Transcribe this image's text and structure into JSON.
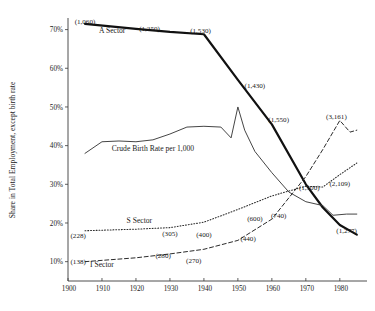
{
  "chart_data": {
    "type": "line",
    "title": "",
    "xlabel": "",
    "ylabel": "Share in Total Employment, except birth rate",
    "xlim": [
      1900,
      1988
    ],
    "ylim": [
      5,
      73
    ],
    "grid": false,
    "legend": "inline-labels",
    "x_ticks": [
      "1900",
      "1910",
      "1920",
      "1930",
      "1940",
      "1950",
      "1960",
      "1970",
      "1980"
    ],
    "x_tick_values": [
      1900,
      1910,
      1920,
      1930,
      1940,
      1950,
      1960,
      1970,
      1980
    ],
    "y_ticks": [
      "10%",
      "20%",
      "30%",
      "40%",
      "50%",
      "60%",
      "70%"
    ],
    "y_tick_values": [
      10,
      20,
      30,
      40,
      50,
      60,
      70
    ],
    "series": [
      {
        "name": "A Sector",
        "style": "thick-solid",
        "x": [
          1905,
          1920,
          1930,
          1940,
          1950,
          1960,
          1970,
          1975,
          1980,
          1985
        ],
        "values": [
          71.5,
          70.2,
          69.4,
          68.8,
          57.0,
          45.5,
          30.0,
          24.0,
          19.5,
          17.0
        ],
        "point_labels": [
          {
            "text": "(1,060)",
            "x": 1905,
            "y": 71.5
          },
          {
            "text": "(1,250)",
            "x": 1924,
            "y": 69.6
          },
          {
            "text": "(1,530)",
            "x": 1939,
            "y": 69.0
          },
          {
            "text": "(1,430)",
            "x": 1955,
            "y": 55.0
          },
          {
            "text": "(1,550)",
            "x": 1962,
            "y": 46.0
          },
          {
            "text": "(1,500)",
            "x": 1971,
            "y": 28.5
          },
          {
            "text": "(1,277)",
            "x": 1982,
            "y": 17.5
          }
        ]
      },
      {
        "name": "Crude Birth Rate per 1,000",
        "style": "thin-solid",
        "x": [
          1905,
          1910,
          1915,
          1920,
          1925,
          1930,
          1935,
          1940,
          1945,
          1948,
          1950,
          1952,
          1955,
          1960,
          1965,
          1970,
          1975,
          1978,
          1982,
          1985
        ],
        "values": [
          38.0,
          41.0,
          41.2,
          41.0,
          41.5,
          43.0,
          44.8,
          45.0,
          44.8,
          42.0,
          50.0,
          44.0,
          38.5,
          33.0,
          28.0,
          25.5,
          24.5,
          22.0,
          22.3,
          22.3
        ]
      },
      {
        "name": "S Sector",
        "style": "dotted",
        "x": [
          1905,
          1920,
          1930,
          1940,
          1950,
          1960,
          1970,
          1975,
          1980,
          1985
        ],
        "values": [
          18.0,
          18.4,
          18.8,
          20.2,
          23.5,
          27.0,
          29.5,
          29.3,
          32.5,
          35.5
        ],
        "point_labels": [
          {
            "text": "(228)",
            "x": 1903,
            "y": 16.2
          },
          {
            "text": "(305)",
            "x": 1930,
            "y": 16.6
          },
          {
            "text": "(400)",
            "x": 1940,
            "y": 16.4
          },
          {
            "text": "(600)",
            "x": 1955,
            "y": 20.5
          },
          {
            "text": "(740)",
            "x": 1962,
            "y": 21.2
          },
          {
            "text": "(2,109)",
            "x": 1980,
            "y": 29.5
          }
        ]
      },
      {
        "name": "I Sector",
        "style": "dashed",
        "x": [
          1905,
          1920,
          1930,
          1940,
          1950,
          1960,
          1970,
          1975,
          1980,
          1983,
          1985
        ],
        "values": [
          10.0,
          11.0,
          12.0,
          13.2,
          15.5,
          21.0,
          32.0,
          39.0,
          46.5,
          43.5,
          44.0
        ],
        "point_labels": [
          {
            "text": "(138)",
            "x": 1903,
            "y": 9.3
          },
          {
            "text": "(280)",
            "x": 1928,
            "y": 11.0
          },
          {
            "text": "(270)",
            "x": 1937,
            "y": 9.6
          },
          {
            "text": "(440)",
            "x": 1953,
            "y": 15.3
          },
          {
            "text": "(3,161)",
            "x": 1979,
            "y": 47.0
          }
        ]
      }
    ],
    "series_inline_labels": [
      {
        "text": "A Sector",
        "x": 1913,
        "y": 69.2
      },
      {
        "text": "Crude Birth Rate per 1,000",
        "x": 1925,
        "y": 38.5
      },
      {
        "text": "S Sector",
        "x": 1921,
        "y": 20.0
      },
      {
        "text": "I Sector",
        "x": 1910,
        "y": 8.7
      }
    ]
  }
}
